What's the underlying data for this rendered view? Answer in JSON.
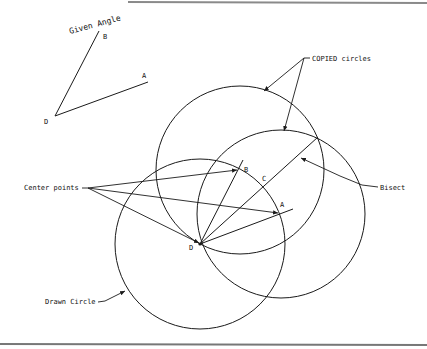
{
  "figure": {
    "given_angle": {
      "label": "Given Angle",
      "vertex_label": "D",
      "ray_b_label": "B",
      "ray_a_label": "A"
    },
    "construction": {
      "vertex_label": "D",
      "point_b_label": "B",
      "point_a_label": "A",
      "point_c_label": "C"
    },
    "callouts": {
      "copied_circles": "COPIED circles",
      "center_points": "Center points",
      "bisect": "Bisect",
      "drawn_circle": "Drawn Circle"
    },
    "colors": {
      "ink": "#1a1a1a",
      "background": "#ffffff",
      "frame": "#808080"
    }
  }
}
